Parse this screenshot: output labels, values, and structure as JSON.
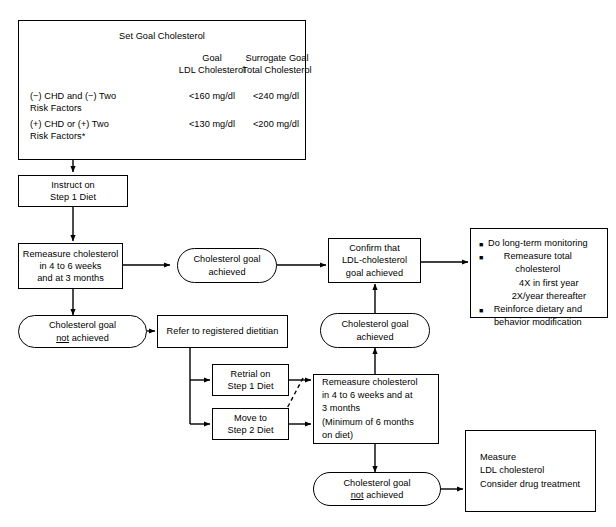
{
  "diagram": {
    "goal_table": {
      "title": "Set Goal Cholesterol",
      "col_headers": [
        {
          "line1": "Goal",
          "line2": "LDL Cholesterol"
        },
        {
          "line1": "Surrogate Goal",
          "line2": "Total Cholesterol"
        }
      ],
      "rows": [
        {
          "label_line1": "(−) CHD and (−) Two",
          "label_line2": "Risk Factors",
          "ldl": "<160 mg/dl",
          "total": "<240 mg/dl"
        },
        {
          "label_line1": "(+) CHD or (+) Two",
          "label_line2": "Risk Factors*",
          "ldl": "<130 mg/dl",
          "total": "<200 mg/dl"
        }
      ]
    },
    "nodes": {
      "instruct_step1": {
        "line1": "Instruct on",
        "line2": "Step 1 Diet"
      },
      "remeasure_1": {
        "line1": "Remeasure cholesterol",
        "line2": "in 4 to 6 weeks",
        "line3": "and at 3 months"
      },
      "goal_achieved_1": {
        "line1": "Cholesterol goal",
        "line2": "achieved"
      },
      "goal_not_achieved_1": {
        "line1": "Cholesterol goal",
        "line2": "not",
        "line2_suffix": " achieved"
      },
      "confirm_ldl": {
        "line1": "Confirm that",
        "line2": "LDL-cholesterol",
        "line3": "goal achieved"
      },
      "followup": {
        "items": [
          "Do long-term monitoring",
          "Remeasure total",
          "Reinforce dietary and"
        ],
        "item2_cont": "cholesterol",
        "item2_sub1": "4X in first year",
        "item2_sub2": "2X/year thereafter",
        "item3_cont": "behavior modification",
        "bullet_glyph": "■"
      },
      "refer_dietitian": {
        "line1": "Refer to registered dietitian"
      },
      "retrial_step1": {
        "line1": "Retrial on",
        "line2": "Step 1 Diet"
      },
      "move_step2": {
        "line1": "Move to",
        "line2": "Step 2 Diet"
      },
      "remeasure_2": {
        "line1": "Remeasure cholesterol",
        "line2": "in 4 to 6 weeks and at",
        "line3": "3 months",
        "line4": "(Minimum of 6 months",
        "line5": "on diet)"
      },
      "goal_achieved_2": {
        "line1": "Cholesterol goal",
        "line2": "achieved"
      },
      "goal_not_achieved_2": {
        "line1": "Cholesterol goal",
        "line2": "not",
        "line2_suffix": " achieved"
      },
      "measure_drug": {
        "line1": "Measure",
        "line2": "LDL cholesterol",
        "line3": "Consider drug treatment"
      }
    },
    "colors": {
      "stroke": "#000000",
      "background": "#ffffff",
      "text": "#000000"
    }
  }
}
